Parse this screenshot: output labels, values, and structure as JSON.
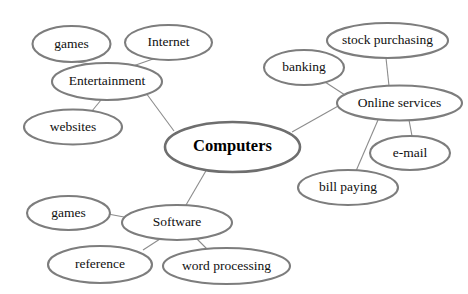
{
  "diagram": {
    "type": "concept-map",
    "background_color": "#ffffff",
    "node_fill": "#ffffff",
    "node_stroke": "#7d7d7d",
    "central_fill_light": "#f2f2f2",
    "central_fill_dark": "#b8b8b8",
    "edge_color": "#8c8c8c",
    "text_color": "#101010",
    "nodes": [
      {
        "id": "games_top",
        "label": "games",
        "cx": 71.5,
        "cy": 44,
        "rx": 39,
        "ry": 18,
        "central": false
      },
      {
        "id": "internet",
        "label": "Internet",
        "cx": 168.5,
        "cy": 42.5,
        "rx": 43.5,
        "ry": 17.5,
        "central": false
      },
      {
        "id": "entertainment",
        "label": "Entertainment",
        "cx": 107,
        "cy": 81.5,
        "rx": 55,
        "ry": 18.5,
        "central": false
      },
      {
        "id": "websites",
        "label": "websites",
        "cx": 73,
        "cy": 127,
        "rx": 49,
        "ry": 17.5,
        "central": false
      },
      {
        "id": "computers",
        "label": "Computers",
        "cx": 232.5,
        "cy": 147,
        "rx": 67.5,
        "ry": 25,
        "central": true
      },
      {
        "id": "stock_purchasing",
        "label": "stock purchasing",
        "cx": 387.5,
        "cy": 40.5,
        "rx": 60.5,
        "ry": 17.5,
        "central": false
      },
      {
        "id": "banking",
        "label": "banking",
        "cx": 304,
        "cy": 67.5,
        "rx": 40,
        "ry": 17.5,
        "central": false
      },
      {
        "id": "online_services",
        "label": "Online services",
        "cx": 399.5,
        "cy": 103,
        "rx": 62.5,
        "ry": 17.5,
        "central": false
      },
      {
        "id": "email",
        "label": "e-mail",
        "cx": 410,
        "cy": 153,
        "rx": 40,
        "ry": 17,
        "central": false
      },
      {
        "id": "bill_paying",
        "label": "bill paying",
        "cx": 348,
        "cy": 187.5,
        "rx": 50,
        "ry": 17.5,
        "central": false
      },
      {
        "id": "games_bottom",
        "label": "games",
        "cx": 68.5,
        "cy": 213,
        "rx": 41.5,
        "ry": 17,
        "central": false
      },
      {
        "id": "software",
        "label": "Software",
        "cx": 177,
        "cy": 222.5,
        "rx": 55,
        "ry": 17.5,
        "central": false
      },
      {
        "id": "reference",
        "label": "reference",
        "cx": 100,
        "cy": 264.5,
        "rx": 52,
        "ry": 18.5,
        "central": false
      },
      {
        "id": "word_processing",
        "label": "word processing",
        "cx": 226.5,
        "cy": 266,
        "rx": 63.5,
        "ry": 18,
        "central": false
      }
    ],
    "edges": [
      {
        "id": "edge-computers-entertainment",
        "from": "computers",
        "to": "entertainment",
        "x1": 174,
        "y1": 131,
        "x2": 146,
        "y2": 93
      },
      {
        "id": "edge-computers-online",
        "from": "computers",
        "to": "online_services",
        "x1": 292,
        "y1": 132,
        "x2": 340,
        "y2": 105
      },
      {
        "id": "edge-computers-software",
        "from": "computers",
        "to": "software",
        "x1": 207,
        "y1": 169,
        "x2": 186,
        "y2": 205
      },
      {
        "id": "edge-entertainment-games",
        "from": "entertainment",
        "to": "games_top",
        "x1": 90,
        "y1": 64,
        "x2": 78,
        "y2": 62
      },
      {
        "id": "edge-entertainment-internet",
        "from": "entertainment",
        "to": "internet",
        "x1": 133,
        "y1": 66,
        "x2": 153,
        "y2": 59
      },
      {
        "id": "edge-entertainment-websites",
        "from": "entertainment",
        "to": "websites",
        "x1": 101,
        "y1": 100,
        "x2": 92,
        "y2": 111
      },
      {
        "id": "edge-online-stock",
        "from": "online_services",
        "to": "stock_purchasing",
        "x1": 389,
        "y1": 86,
        "x2": 386,
        "y2": 58
      },
      {
        "id": "edge-online-banking",
        "from": "online_services",
        "to": "banking",
        "x1": 345,
        "y1": 95,
        "x2": 325,
        "y2": 82
      },
      {
        "id": "edge-online-email",
        "from": "online_services",
        "to": "email",
        "x1": 409,
        "y1": 120,
        "x2": 412,
        "y2": 136
      },
      {
        "id": "edge-online-billpaying",
        "from": "online_services",
        "to": "bill_paying",
        "x1": 378,
        "y1": 120,
        "x2": 356,
        "y2": 171
      },
      {
        "id": "edge-software-games",
        "from": "software",
        "to": "games_bottom",
        "x1": 124,
        "y1": 217,
        "x2": 108,
        "y2": 214
      },
      {
        "id": "edge-software-reference",
        "from": "software",
        "to": "reference",
        "x1": 160,
        "y1": 239,
        "x2": 143,
        "y2": 250
      },
      {
        "id": "edge-software-wordprocessing",
        "from": "software",
        "to": "word_processing",
        "x1": 197,
        "y1": 239,
        "x2": 207,
        "y2": 249
      }
    ]
  }
}
